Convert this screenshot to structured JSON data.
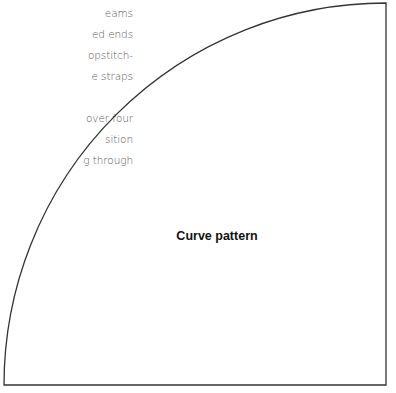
{
  "body_text": {
    "lines": [
      "eams",
      "ed ends",
      "opstitch-",
      "e straps",
      "",
      "over four",
      "sition",
      "g through"
    ]
  },
  "pattern": {
    "label": "Curve pattern",
    "shape": "quarter-circle",
    "stroke_color": "#333333"
  }
}
